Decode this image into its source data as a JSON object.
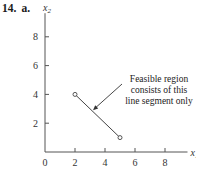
{
  "problem": {
    "number": "14.",
    "part": "a."
  },
  "chart_data": {
    "type": "line",
    "title": "",
    "xlabel": "x1",
    "ylabel": "x2",
    "xlim": [
      0,
      9.5
    ],
    "ylim": [
      0,
      9.5
    ],
    "xticks": [
      0,
      2,
      4,
      6,
      8
    ],
    "yticks": [
      2,
      4,
      6,
      8
    ],
    "grid": false,
    "series": [
      {
        "name": "Feasible region",
        "points": [
          [
            2,
            4
          ],
          [
            5,
            1
          ]
        ],
        "markers": "open-circle-endpoints"
      }
    ],
    "annotation": {
      "text_lines": [
        "Feasible region",
        "consists of this",
        "line segment only"
      ],
      "arrow_points_to": [
        3.2,
        2.9
      ]
    }
  }
}
